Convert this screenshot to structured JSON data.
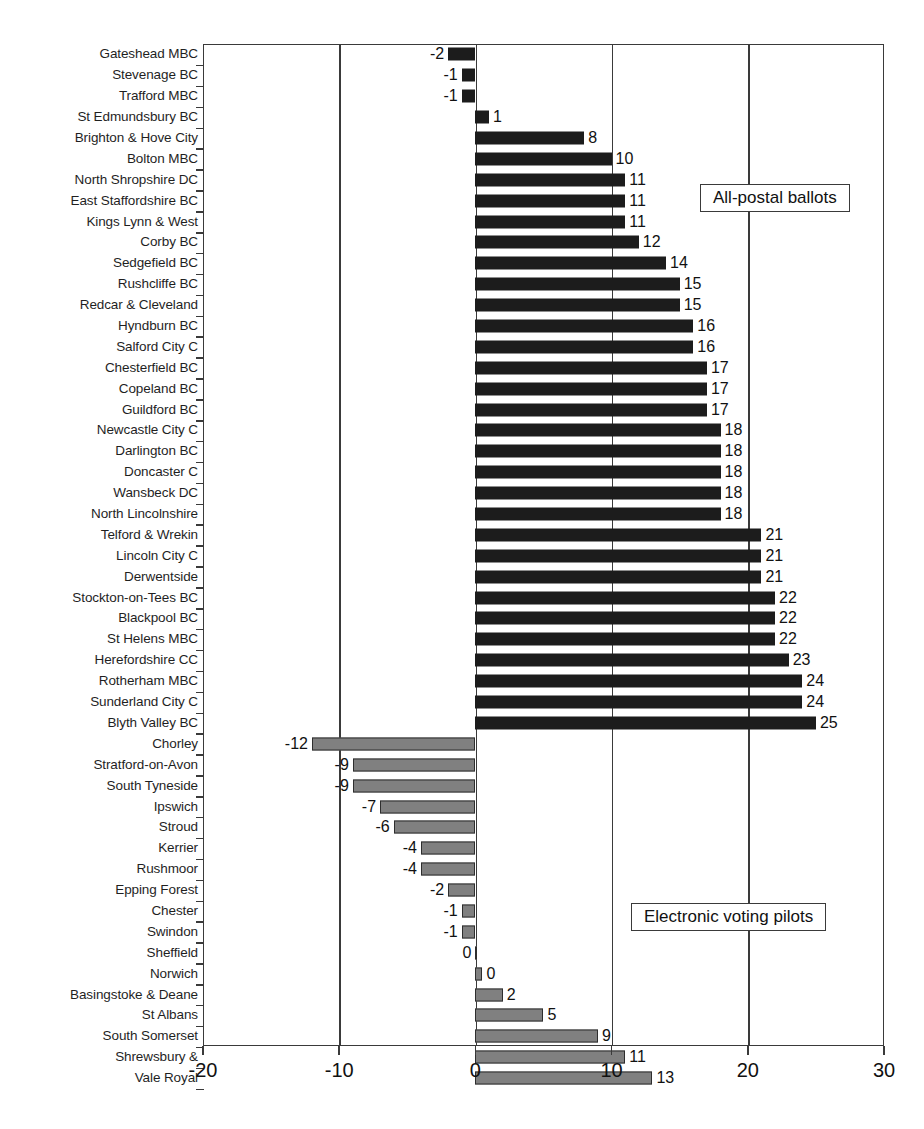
{
  "chart_data": {
    "type": "bar",
    "orientation": "horizontal",
    "title": "",
    "subtitle": "",
    "xlabel": "",
    "ylabel": "",
    "xlim": [
      -20,
      30
    ],
    "xticks": [
      -20,
      -10,
      0,
      10,
      20,
      30
    ],
    "xtick_labels": [
      "-20",
      "-10",
      "0",
      "10",
      "20",
      "30"
    ],
    "grid": true,
    "grid_axis": "x",
    "legend_position": "inside-right",
    "colors": {
      "all_postal": "#1c1c1c",
      "electronic_voting": "#808080",
      "axis": "#3a3a3a",
      "text": "#111111"
    },
    "series": [
      {
        "name": "All-postal ballots",
        "color": "#1c1c1c",
        "categories": [
          "Gateshead MBC",
          "Stevenage BC",
          "Trafford MBC",
          "St Edmundsbury BC",
          "Brighton & Hove City",
          "Bolton MBC",
          "North Shropshire DC",
          "East Staffordshire BC",
          "Kings Lynn & West",
          "Corby BC",
          "Sedgefield BC",
          "Rushcliffe BC",
          "Redcar & Cleveland",
          "Hyndburn BC",
          "Salford City C",
          "Chesterfield BC",
          "Copeland BC",
          "Guildford BC",
          "Newcastle City C",
          "Darlington BC",
          "Doncaster C",
          "Wansbeck DC",
          "North Lincolnshire",
          "Telford & Wrekin",
          "Lincoln City C",
          "Derwentside",
          "Stockton-on-Tees BC",
          "Blackpool BC",
          "St Helens MBC",
          "Herefordshire CC",
          "Rotherham MBC",
          "Sunderland City C",
          "Blyth Valley BC"
        ],
        "values": [
          -2,
          -1,
          -1,
          1,
          8,
          10,
          11,
          11,
          11,
          12,
          14,
          15,
          15,
          16,
          16,
          17,
          17,
          17,
          18,
          18,
          18,
          18,
          18,
          21,
          21,
          21,
          22,
          22,
          22,
          23,
          24,
          24,
          25
        ],
        "value_labels": [
          "-2",
          "-1",
          "-1",
          "1",
          "8",
          "10",
          "11",
          "11",
          "11",
          "12",
          "14",
          "15",
          "15",
          "16",
          "16",
          "17",
          "17",
          "17",
          "18",
          "18",
          "18",
          "18",
          "18",
          "21",
          "21",
          "21",
          "22",
          "22",
          "22",
          "23",
          "24",
          "24",
          "25"
        ]
      },
      {
        "name": "Electronic voting pilots",
        "color": "#808080",
        "categories": [
          "Chorley",
          "Stratford-on-Avon",
          "South Tyneside",
          "Ipswich",
          "Stroud",
          "Kerrier",
          "Rushmoor",
          "Epping Forest",
          "Chester",
          "Swindon",
          "Sheffield",
          "Norwich",
          "Basingstoke & Deane",
          "St Albans",
          "South Somerset",
          "Shrewsbury &",
          "Vale Royal"
        ],
        "values": [
          -12,
          -9,
          -9,
          -7,
          -6,
          -4,
          -4,
          -2,
          -1,
          -1,
          0,
          0,
          2,
          5,
          9,
          11,
          13
        ],
        "value_labels": [
          "-12",
          "-9",
          "-9",
          "-7",
          "-6",
          "-4",
          "-4",
          "-2",
          "-1",
          "-1",
          "0",
          "0",
          "2",
          "5",
          "9",
          "11",
          "13"
        ]
      }
    ]
  },
  "legends": {
    "postal": "All-postal ballots",
    "evote": "Electronic voting pilots"
  }
}
